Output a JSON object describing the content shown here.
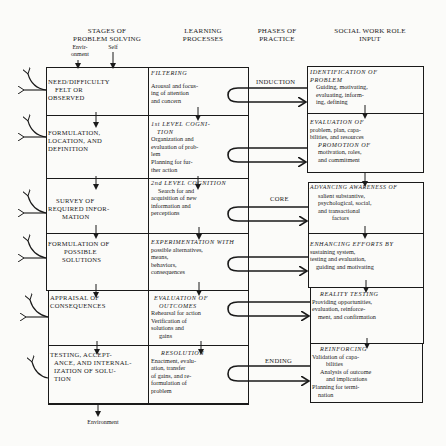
{
  "headers": {
    "stages": [
      "STAGES OF",
      "PROBLEM SOLVING"
    ],
    "environment_sub": [
      "Envir-",
      "onment"
    ],
    "self_sub": "Self",
    "learning": [
      "LEARNING",
      "PROCESSES"
    ],
    "phases": [
      "PHASES OF",
      "PRACTICE"
    ],
    "role": [
      "SOCIAL WORK ROLE",
      "INPUT"
    ]
  },
  "stages": [
    {
      "lines": [
        "NEED/DIFFICULTY",
        "FELT OR",
        "OBSERVED"
      ]
    },
    {
      "lines": [
        "FORMULATION,",
        "LOCATION, AND",
        "DEFINITION"
      ]
    },
    {
      "lines": [
        "SURVEY OF",
        "REQUIRED INFOR-",
        "MATION"
      ]
    },
    {
      "lines": [
        "FORMULATION OF",
        "POSSIBLE",
        "SOLUTIONS"
      ]
    },
    {
      "lines": [
        "APPRAISAL OF",
        "CONSEQUENCES"
      ]
    },
    {
      "lines": [
        "TESTING, ACCEPT-",
        "ANCE, AND INTERNAL-",
        "IZATION OF SOLU-",
        "TION"
      ]
    }
  ],
  "learning": [
    {
      "title": "FILTERING",
      "lines": [
        "Arousal and focus-",
        "ing of attention",
        "and concern"
      ]
    },
    {
      "title": "1st LEVEL COGNI-",
      "title2": "TION",
      "lines": [
        "Organization and",
        "evaluation of prob-",
        "lem",
        "Planning for fur-",
        "ther action"
      ]
    },
    {
      "title": "2nd LEVEL COGNITION",
      "lines": [
        "Search for and",
        "acquisition of new",
        "information and",
        "perceptions"
      ]
    },
    {
      "title": "EXPERIMENTATION WITH",
      "lines": [
        "possible alternatives,",
        "means,",
        "behaviors,",
        "consequences"
      ]
    },
    {
      "title": "EVALUATION OF",
      "title2": "OUTCOMES",
      "lines": [
        "Rehearsal for action",
        "Verification of",
        "solutions and",
        "gains"
      ]
    },
    {
      "title": "RESOLUTION",
      "lines": [
        "Enactment, evalu-",
        "ation, transfer",
        "of gains, and re-",
        "formulation of",
        "problem"
      ]
    }
  ],
  "phases": {
    "induction": "INDUCTION",
    "core": "CORE",
    "ending": "ENDING"
  },
  "roles": [
    {
      "title": "IDENTIFICATION OF",
      "title2": "PROBLEM",
      "lines": [
        "Guiding, motivating,",
        "evaluating, inform-",
        "ing, defining"
      ]
    },
    {
      "title": "EVALUATION OF",
      "lines": [
        "problem, plan, capa-",
        "bilities, and resources"
      ],
      "title3": "PROMOTION OF",
      "lines2": [
        "motivation, roles,",
        "and commitment"
      ]
    },
    {
      "title": "ADVANCING AWARENESS OF",
      "lines": [
        "salient substantive,",
        "psychological, social,",
        "and transactional",
        "factors"
      ]
    },
    {
      "title": "ENHANCING EFFORTS BY",
      "lines": [
        "sustaining system,",
        "testing and evaluation,",
        "guiding and motivating"
      ]
    },
    {
      "title": "REALITY TESTING",
      "lines": [
        "Providing opportunities,",
        "evaluation, reinforce-",
        "ment, and confirmation"
      ]
    },
    {
      "title": "REINFORCING",
      "lines": [
        "Validation of capa-",
        "bilities",
        "Analysis of outcome",
        "and implications",
        "Planning for termi-",
        "nation"
      ]
    }
  ],
  "footer": {
    "environment": "Environment"
  },
  "colors": {
    "ink": "#1a1a1a",
    "paper": "#fbfbf9"
  }
}
